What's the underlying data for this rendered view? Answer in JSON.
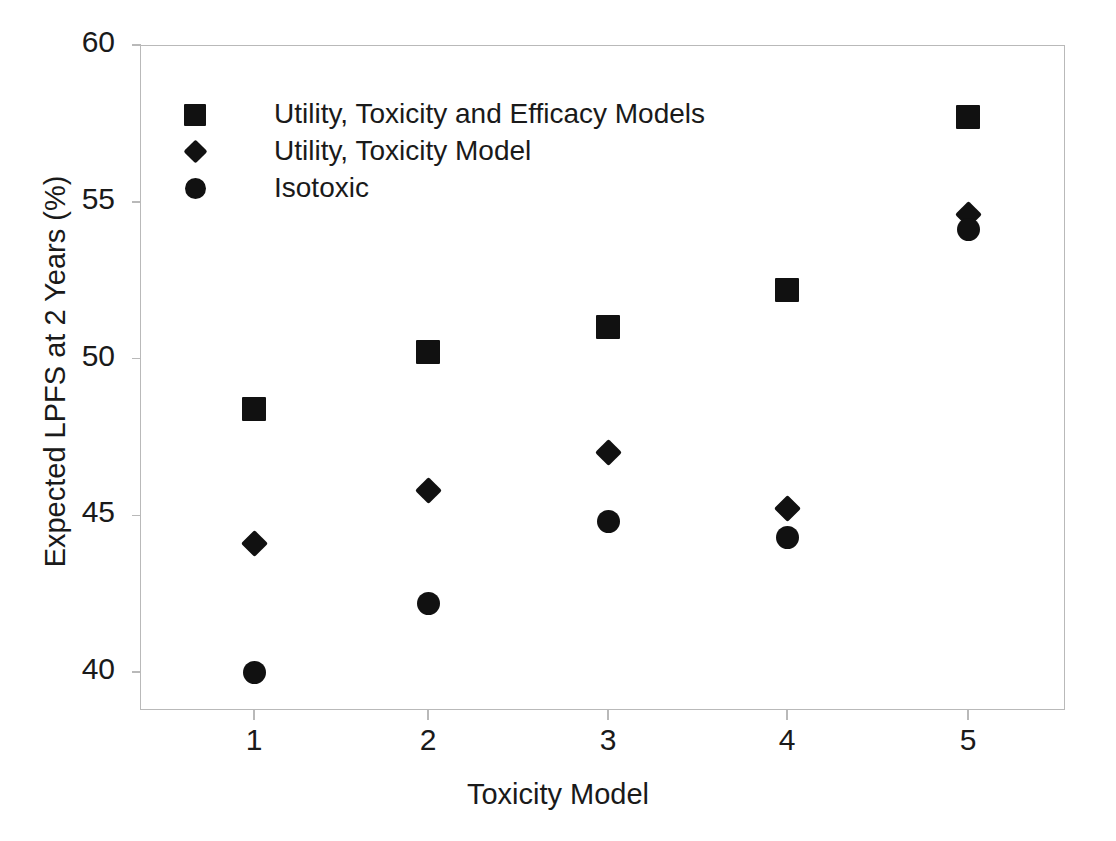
{
  "chart_data": {
    "type": "scatter",
    "title": "",
    "xlabel": "Toxicity Model",
    "ylabel": "Expected LPFS at 2 Years (%)",
    "xlim": [
      0.5,
      5.5
    ],
    "ylim": [
      38.0,
      60.0
    ],
    "xticks": [
      "1",
      "2",
      "3",
      "4",
      "5"
    ],
    "yticks": [
      "40",
      "45",
      "50",
      "55",
      "60"
    ],
    "x": [
      1,
      2,
      3,
      4,
      5
    ],
    "grid": false,
    "legend_position": "top-left-inside",
    "series": [
      {
        "name": "Utility, Toxicity and Efficacy Models",
        "marker": "square",
        "color": "#111111",
        "values": [
          48.4,
          50.2,
          51.0,
          52.2,
          57.7
        ]
      },
      {
        "name": "Utility, Toxicity Model",
        "marker": "diamond",
        "color": "#111111",
        "values": [
          44.1,
          45.8,
          47.0,
          45.2,
          54.6
        ]
      },
      {
        "name": "Isotoxic",
        "marker": "circle",
        "color": "#111111",
        "values": [
          40.0,
          42.2,
          44.8,
          44.3,
          54.1
        ]
      }
    ]
  },
  "axis": {
    "y_title": "Expected LPFS at 2 Years (%)",
    "x_title": "Toxicity Model",
    "y_ticks": [
      {
        "label": "60",
        "value": 60
      },
      {
        "label": "55",
        "value": 55
      },
      {
        "label": "50",
        "value": 50
      },
      {
        "label": "45",
        "value": 45
      },
      {
        "label": "40",
        "value": 40
      }
    ],
    "x_ticks": [
      {
        "label": "1",
        "value": 1
      },
      {
        "label": "2",
        "value": 2
      },
      {
        "label": "3",
        "value": 3
      },
      {
        "label": "4",
        "value": 4
      },
      {
        "label": "5",
        "value": 5
      }
    ]
  },
  "legend": {
    "entries": [
      {
        "marker": "square",
        "label": "Utility, Toxicity and Efficacy Models"
      },
      {
        "marker": "diamond",
        "label": "Utility, Toxicity Model"
      },
      {
        "marker": "circle",
        "label": "Isotoxic"
      }
    ]
  },
  "colors": {
    "marker": "#111111",
    "frame": "#b9b9b9",
    "text": "#1a1a1a",
    "background": "#ffffff"
  }
}
